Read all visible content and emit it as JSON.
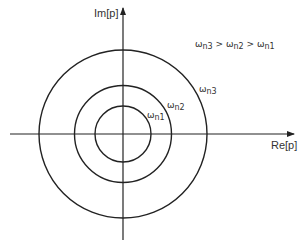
{
  "diagram": {
    "axes": {
      "x_label": "Re[p]",
      "y_label": "Im[p]"
    },
    "relation": "ωn3 > ωn2 > ωn1",
    "circles": [
      {
        "label_symbol": "ω",
        "label_sub": "n1",
        "radius": 28
      },
      {
        "label_symbol": "ω",
        "label_sub": "n2",
        "radius": 49
      },
      {
        "label_symbol": "ω",
        "label_sub": "n3",
        "radius": 83
      }
    ],
    "center": {
      "x": 123,
      "y": 134
    },
    "stroke_color": "#222222"
  }
}
